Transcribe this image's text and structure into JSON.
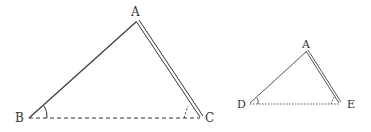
{
  "figure": {
    "left_triangle": {
      "vertices": {
        "A": "A",
        "B": "B",
        "C": "C"
      },
      "sides": {
        "AB": "solid",
        "AC": "double",
        "BC": "dashed"
      },
      "angles_marked": [
        "B",
        "C"
      ]
    },
    "right_triangle": {
      "vertices": {
        "A": "A",
        "D": "D",
        "E": "E"
      },
      "sides": {
        "AD": "solid",
        "AE": "double",
        "DE": "dotted"
      },
      "angles_marked": [
        "D",
        "E"
      ]
    },
    "colors": {
      "stroke": "#333333",
      "background": "#ffffff"
    }
  }
}
